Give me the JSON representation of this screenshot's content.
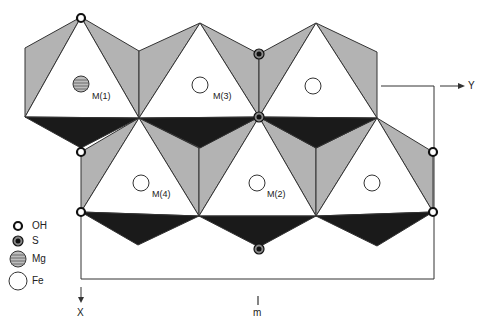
{
  "figure": {
    "colors": {
      "white_face": "#ffffff",
      "gray_face": "#b3b3b3",
      "dark_face": "#1a1a1a",
      "line": "#333333"
    }
  },
  "sites": [
    {
      "id": "M(1)",
      "label": "M(1)",
      "occupant": "Mg"
    },
    {
      "id": "M(3)",
      "label": "M(3)",
      "occupant": "Fe"
    },
    {
      "id": "M(4)",
      "label": "M(4)",
      "occupant": "Fe"
    },
    {
      "id": "M(2)",
      "label": "M(2)",
      "occupant": "Fe"
    }
  ],
  "axes": {
    "x_label": "X",
    "y_label": "Y",
    "mirror_label": "m"
  },
  "legend": {
    "items": [
      {
        "symbol": "OH",
        "label": "OH"
      },
      {
        "symbol": "S",
        "label": "S"
      },
      {
        "symbol": "Mg",
        "label": "Mg"
      },
      {
        "symbol": "Fe",
        "label": "Fe"
      }
    ]
  }
}
